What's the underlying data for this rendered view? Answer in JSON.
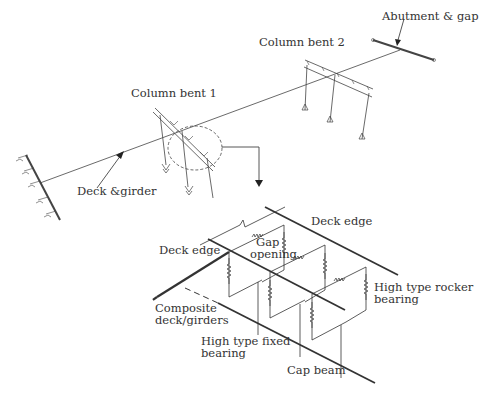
{
  "figure": {
    "overview": {
      "labels": {
        "abutment_gap": "Abutment & gap",
        "column_bent_2": "Column bent 2",
        "column_bent_1": "Column bent 1",
        "deck_girder": "Deck &girder"
      }
    },
    "detail": {
      "labels": {
        "deck_edge_top": "Deck edge",
        "deck_edge_left": "Deck edge",
        "gap_opening_line1": "Gap",
        "gap_opening_line2": "opening",
        "rocker_line1": "High type rocker",
        "rocker_line2": "bearing",
        "composite_line1": "Composite",
        "composite_line2": "deck/girders",
        "fixed_line1": "High type fixed",
        "fixed_line2": "bearing",
        "cap_beam": "Cap beam"
      }
    },
    "colors": {
      "line": "#333333",
      "thin_line": "#555555",
      "text": "#333333"
    }
  }
}
